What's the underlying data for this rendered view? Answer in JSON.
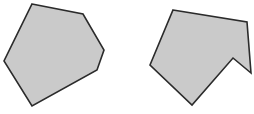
{
  "canvas": {
    "width": 254,
    "height": 114,
    "background_color": "#ffffff"
  },
  "figure": {
    "description_left": "convex hexagon",
    "description_right": "concave hexagon with notch",
    "fill_color": "#cacaca",
    "stroke_color": "#2b2b2b",
    "stroke_width": "1.6"
  },
  "shapes": [
    {
      "id": "left-convex-polygon",
      "points": "32,4 83,14 104,50 97,70 32,106 4,61",
      "fill": "#cacaca",
      "stroke": "#2b2b2b",
      "stroke_width": "1.6"
    },
    {
      "id": "right-notched-polygon",
      "points": "173,10 247,22 251,73 233,58 192,105 150,65",
      "fill": "#cacaca",
      "stroke": "#2b2b2b",
      "stroke_width": "1.6"
    }
  ]
}
